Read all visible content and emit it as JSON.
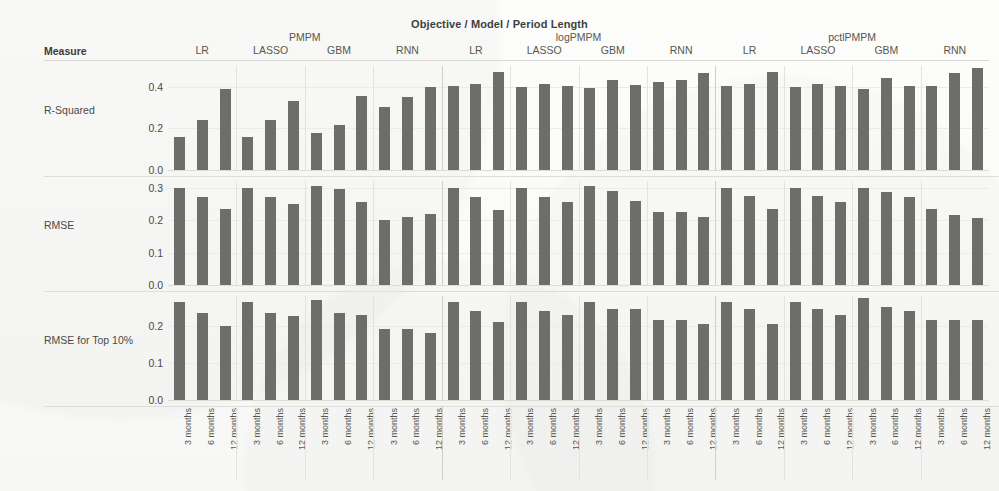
{
  "chart_title": "Objective / Model / Period Length",
  "measure_header": "Measure",
  "axis": {
    "objectives": [
      "PMPM",
      "logPMPM",
      "pctlPMPM"
    ],
    "models": [
      "LR",
      "LASSO",
      "GBM",
      "RNN"
    ],
    "periods": [
      "3 months",
      "6 months",
      "12 months"
    ]
  },
  "chart_data": {
    "type": "bar",
    "title": "Objective / Model / Period Length",
    "xlabel": "Objective / Model / Period Length",
    "ylabel": "Measure",
    "grid": true,
    "legend": null,
    "layout": "3 rows (measures) x 12 columns (3 objectives x 4 models), 3 bars per panel (period length)",
    "bar_color": "#6d6d6b",
    "categories": [
      "3 months",
      "6 months",
      "12 months"
    ],
    "rows": [
      {
        "measure": "R-Squared",
        "ylim": [
          0,
          0.5
        ],
        "yticks": [
          0.0,
          0.2,
          0.4
        ],
        "ytick_labels": [
          "0.0",
          "0.2",
          "0.4"
        ],
        "panels": [
          {
            "objective": "PMPM",
            "model": "LR",
            "values": [
              0.16,
              0.24,
              0.39
            ]
          },
          {
            "objective": "PMPM",
            "model": "LASSO",
            "values": [
              0.16,
              0.24,
              0.33
            ]
          },
          {
            "objective": "PMPM",
            "model": "GBM",
            "values": [
              0.18,
              0.215,
              0.355
            ]
          },
          {
            "objective": "PMPM",
            "model": "RNN",
            "values": [
              0.305,
              0.35,
              0.4
            ]
          },
          {
            "objective": "logPMPM",
            "model": "LR",
            "values": [
              0.405,
              0.415,
              0.47
            ]
          },
          {
            "objective": "logPMPM",
            "model": "LASSO",
            "values": [
              0.4,
              0.415,
              0.405
            ]
          },
          {
            "objective": "logPMPM",
            "model": "GBM",
            "values": [
              0.395,
              0.435,
              0.41
            ]
          },
          {
            "objective": "logPMPM",
            "model": "RNN",
            "values": [
              0.425,
              0.435,
              0.465
            ]
          },
          {
            "objective": "pctlPMPM",
            "model": "LR",
            "values": [
              0.405,
              0.415,
              0.47
            ]
          },
          {
            "objective": "pctlPMPM",
            "model": "LASSO",
            "values": [
              0.4,
              0.415,
              0.405
            ]
          },
          {
            "objective": "pctlPMPM",
            "model": "GBM",
            "values": [
              0.39,
              0.44,
              0.405
            ]
          },
          {
            "objective": "pctlPMPM",
            "model": "RNN",
            "values": [
              0.405,
              0.465,
              0.49
            ]
          }
        ]
      },
      {
        "measure": "RMSE",
        "ylim": [
          0,
          0.32
        ],
        "yticks": [
          0.0,
          0.1,
          0.2,
          0.3
        ],
        "ytick_labels": [
          "0.0",
          "0.1",
          "0.2",
          "0.3"
        ],
        "panels": [
          {
            "objective": "PMPM",
            "model": "LR",
            "values": [
              0.3,
              0.27,
              0.235
            ]
          },
          {
            "objective": "PMPM",
            "model": "LASSO",
            "values": [
              0.3,
              0.27,
              0.25
            ]
          },
          {
            "objective": "PMPM",
            "model": "GBM",
            "values": [
              0.305,
              0.295,
              0.255
            ]
          },
          {
            "objective": "PMPM",
            "model": "RNN",
            "values": [
              0.2,
              0.21,
              0.22
            ]
          },
          {
            "objective": "logPMPM",
            "model": "LR",
            "values": [
              0.3,
              0.27,
              0.23
            ]
          },
          {
            "objective": "logPMPM",
            "model": "LASSO",
            "values": [
              0.3,
              0.27,
              0.255
            ]
          },
          {
            "objective": "logPMPM",
            "model": "GBM",
            "values": [
              0.305,
              0.29,
              0.26
            ]
          },
          {
            "objective": "logPMPM",
            "model": "RNN",
            "values": [
              0.225,
              0.225,
              0.21
            ]
          },
          {
            "objective": "pctlPMPM",
            "model": "LR",
            "values": [
              0.3,
              0.275,
              0.235
            ]
          },
          {
            "objective": "pctlPMPM",
            "model": "LASSO",
            "values": [
              0.3,
              0.275,
              0.255
            ]
          },
          {
            "objective": "pctlPMPM",
            "model": "GBM",
            "values": [
              0.3,
              0.285,
              0.27
            ]
          },
          {
            "objective": "pctlPMPM",
            "model": "RNN",
            "values": [
              0.235,
              0.215,
              0.205
            ]
          }
        ]
      },
      {
        "measure": "RMSE for Top 10%",
        "ylim": [
          0,
          0.28
        ],
        "yticks": [
          0.0,
          0.1,
          0.2
        ],
        "ytick_labels": [
          "0.0",
          "0.1",
          "0.2"
        ],
        "panels": [
          {
            "objective": "PMPM",
            "model": "LR",
            "values": [
              0.265,
              0.235,
              0.2
            ]
          },
          {
            "objective": "PMPM",
            "model": "LASSO",
            "values": [
              0.265,
              0.235,
              0.225
            ]
          },
          {
            "objective": "PMPM",
            "model": "GBM",
            "values": [
              0.27,
              0.235,
              0.23
            ]
          },
          {
            "objective": "PMPM",
            "model": "RNN",
            "values": [
              0.19,
              0.19,
              0.18
            ]
          },
          {
            "objective": "logPMPM",
            "model": "LR",
            "values": [
              0.265,
              0.24,
              0.21
            ]
          },
          {
            "objective": "logPMPM",
            "model": "LASSO",
            "values": [
              0.265,
              0.24,
              0.23
            ]
          },
          {
            "objective": "logPMPM",
            "model": "GBM",
            "values": [
              0.265,
              0.245,
              0.245
            ]
          },
          {
            "objective": "logPMPM",
            "model": "RNN",
            "values": [
              0.215,
              0.215,
              0.205
            ]
          },
          {
            "objective": "pctlPMPM",
            "model": "LR",
            "values": [
              0.265,
              0.245,
              0.205
            ]
          },
          {
            "objective": "pctlPMPM",
            "model": "LASSO",
            "values": [
              0.265,
              0.245,
              0.23
            ]
          },
          {
            "objective": "pctlPMPM",
            "model": "GBM",
            "values": [
              0.275,
              0.25,
              0.24
            ]
          },
          {
            "objective": "pctlPMPM",
            "model": "RNN",
            "values": [
              0.215,
              0.215,
              0.215
            ]
          }
        ]
      }
    ]
  }
}
